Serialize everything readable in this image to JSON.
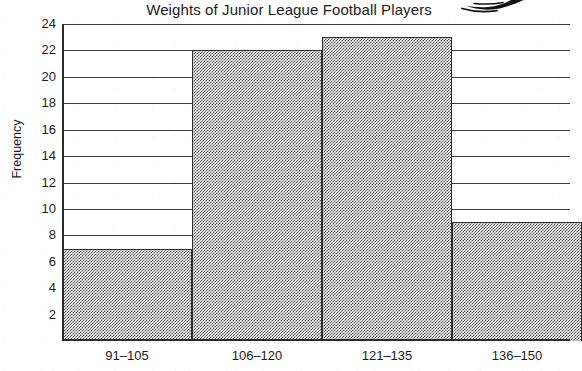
{
  "chart_data": {
    "type": "bar",
    "title": "Weights of Junior League Football Players",
    "xlabel": "",
    "ylabel": "Frequency",
    "categories": [
      "91–105",
      "106–120",
      "121–135",
      "136–150"
    ],
    "values": [
      7,
      22,
      23,
      9
    ],
    "ylim": [
      0,
      24
    ],
    "yticks": [
      2,
      4,
      6,
      8,
      10,
      12,
      14,
      16,
      18,
      20,
      22,
      24
    ],
    "ytick_labels": [
      "2",
      "4",
      "6",
      "8",
      "10",
      "12",
      "14",
      "16",
      "18",
      "20",
      "22",
      "24"
    ],
    "grid": true,
    "legend": false,
    "bar_style": "gray-dither-fill-with-black-outline",
    "colors": {
      "bar_fill": "#9a9a9a",
      "bar_outline": "#2e2e2e",
      "gridline": "#3c3c3c",
      "axis": "#2a2a2a",
      "text": "#1c1c1c",
      "background": "#ffffff"
    }
  },
  "annotations": {
    "doodle": "ink-scribble-artifact-top-right"
  }
}
